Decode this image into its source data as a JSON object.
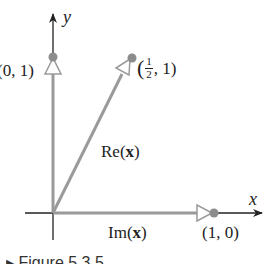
{
  "diagram": {
    "axes": {
      "x_label": "x",
      "y_label": "y"
    },
    "points": [
      {
        "label": "(0, 1)",
        "x": 0,
        "y": 1
      },
      {
        "label_open": "(",
        "frac_num": "1",
        "frac_den": "2",
        "label_close": ", 1)",
        "x": 0.5,
        "y": 1
      },
      {
        "label": "(1, 0)",
        "x": 1,
        "y": 0
      }
    ],
    "vectors": [
      {
        "name": "Re(x)",
        "text": "Re(",
        "bold": "x",
        "close": ")",
        "to": [
          0.5,
          1
        ]
      },
      {
        "name": "Im(x)",
        "text": "Im(",
        "bold": "x",
        "close": ")",
        "to": [
          1,
          0
        ]
      }
    ],
    "caption_fragment": "▸ Figure 5.3.5",
    "colors": {
      "vector": "#9a9a9a",
      "point": "#8c8c8c",
      "axis": "#222222"
    }
  }
}
